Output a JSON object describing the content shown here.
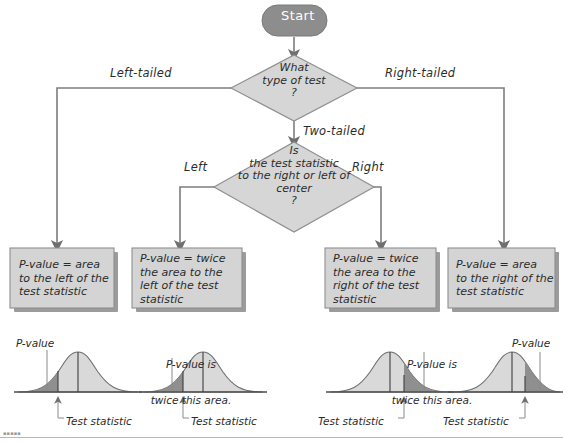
{
  "figure": {
    "type": "flowchart"
  },
  "start": {
    "label": "Start"
  },
  "decisions": [
    {
      "id": "test-type",
      "lines": [
        "What",
        "type of test",
        "?"
      ]
    },
    {
      "id": "statistic-side",
      "lines": [
        "Is",
        "the test statistic",
        "to the right or left of",
        "center",
        "?"
      ]
    }
  ],
  "edges": {
    "left_tailed": "Left-tailed",
    "right_tailed": "Right-tailed",
    "two_tailed": "Two-tailed",
    "left": "Left",
    "right": "Right"
  },
  "boxes": [
    {
      "id": "box-left-tailed",
      "lines": [
        "P-value = area",
        "to the left of the",
        "test statistic"
      ]
    },
    {
      "id": "box-two-tailed-left",
      "lines": [
        "P-value = twice",
        "the area to the",
        "left of the test",
        "statistic"
      ]
    },
    {
      "id": "box-two-tailed-right",
      "lines": [
        "P-value = twice",
        "the area to the",
        "right of the test",
        "statistic"
      ]
    },
    {
      "id": "box-right-tailed",
      "lines": [
        "P-value = area",
        "to the right of the",
        "test statistic"
      ]
    }
  ],
  "curves": [
    {
      "id": "curve-left-tailed",
      "shaded_side": "left",
      "pvalue_label": "P-value",
      "pvalue_label_lines": [
        "P-value"
      ],
      "statistic_label": "Test statistic"
    },
    {
      "id": "curve-two-tailed-left",
      "shaded_side": "left",
      "pvalue_label": "P-value is twice this area.",
      "pvalue_label_lines": [
        "P-value is",
        "twice this area."
      ],
      "statistic_label": "Test statistic"
    },
    {
      "id": "curve-two-tailed-right",
      "shaded_side": "right",
      "pvalue_label": "P-value is twice this area.",
      "pvalue_label_lines": [
        "P-value is",
        "twice this area."
      ],
      "statistic_label": "Test statistic"
    },
    {
      "id": "curve-right-tailed",
      "shaded_side": "right",
      "pvalue_label": "P-value",
      "pvalue_label_lines": [
        "P-value"
      ],
      "statistic_label": "Test statistic"
    }
  ],
  "colors": {
    "start_fill": "#8d8d8d",
    "start_text": "#ffffff",
    "shape_fill": "#d6d6d6",
    "shape_stroke": "#8f8f8f",
    "box_fill": "#d4d4d4",
    "shadow": "#9b9b9b",
    "line": "#7d7d7d",
    "text": "#2b2b2b",
    "curve_fill": "#d9d9d9",
    "curve_tail_fill": "#8f8f8f",
    "curve_stroke": "#6f6f6f"
  }
}
